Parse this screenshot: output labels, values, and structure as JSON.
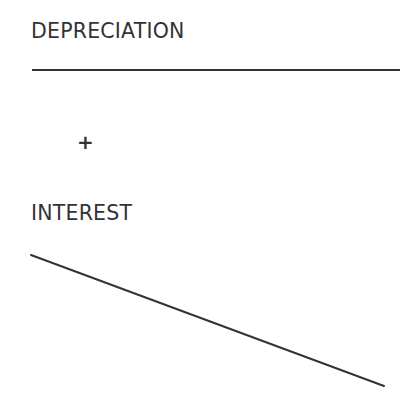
{
  "diagram": {
    "components": [
      {
        "label": "DEPRECIATION",
        "shape": "horizontal-line",
        "line": {
          "x1": 32,
          "y1": 70,
          "x2": 400,
          "y2": 70
        }
      },
      {
        "label": "INTEREST",
        "shape": "declining-line",
        "line": {
          "x1": 31,
          "y1": 255,
          "x2": 384,
          "y2": 386
        }
      }
    ],
    "operator": "+",
    "line_color": "#333333"
  }
}
